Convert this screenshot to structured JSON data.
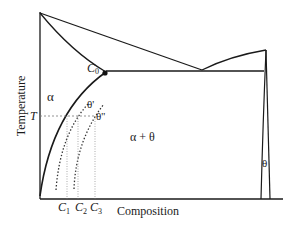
{
  "diagram": {
    "type": "binary phase diagram",
    "axes": {
      "x_label": "Composition",
      "y_label": "Temperature"
    },
    "phase_labels": {
      "alpha": "α",
      "alpha_theta": "α + θ",
      "theta": "θ",
      "theta_prime": "θ'",
      "theta_double_prime": "θ''"
    },
    "point_labels": {
      "c0": "C",
      "c0_sub": "0",
      "temperature_mark": "T"
    },
    "composition_labels": [
      {
        "main": "C",
        "sub": "1"
      },
      {
        "main": "C",
        "sub": "2"
      },
      {
        "main": "C",
        "sub": "3"
      }
    ],
    "colors": {
      "line": "#1a1a1a",
      "dotted": "#333333",
      "guide": "#777777",
      "background": "#ffffff"
    }
  }
}
